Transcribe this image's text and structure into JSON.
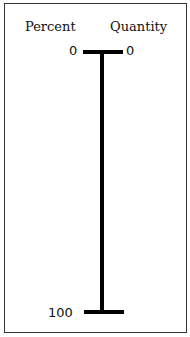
{
  "headers": {
    "left": "Percent",
    "right": "Quantity"
  },
  "scale": {
    "top_left_label": "0",
    "top_right_label": "0",
    "bottom_left_label": "100"
  },
  "colors": {
    "line": "#000000",
    "border": "#333333",
    "background": "#ffffff"
  }
}
